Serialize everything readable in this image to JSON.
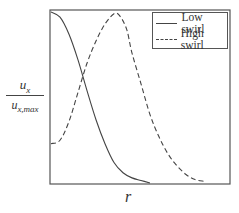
{
  "chart_data": {
    "type": "line",
    "title": "",
    "xlabel": "r",
    "ylabel": "u_x / u_x,max",
    "ylabel_numerator": "u",
    "ylabel_numerator_sub": "x",
    "ylabel_denominator": "u",
    "ylabel_denominator_sub": "x,max",
    "grid": false,
    "ticks": false,
    "legend_position": "upper right",
    "xlim": [
      0,
      1
    ],
    "ylim": [
      0,
      1
    ],
    "series": [
      {
        "name": "Low swirl",
        "style": "solid",
        "x": [
          0.0,
          0.05,
          0.1,
          0.15,
          0.2,
          0.25,
          0.3,
          0.35,
          0.4,
          0.45,
          0.5,
          0.55
        ],
        "y": [
          1.0,
          0.97,
          0.87,
          0.72,
          0.54,
          0.37,
          0.23,
          0.12,
          0.06,
          0.03,
          0.015,
          0.0
        ]
      },
      {
        "name": "High swirl",
        "style": "dashed",
        "x": [
          0.0,
          0.05,
          0.1,
          0.15,
          0.2,
          0.25,
          0.3,
          0.35,
          0.38,
          0.42,
          0.45,
          0.5,
          0.55,
          0.6,
          0.65,
          0.7,
          0.75,
          0.8,
          0.85
        ],
        "y": [
          0.23,
          0.25,
          0.36,
          0.53,
          0.7,
          0.83,
          0.93,
          0.99,
          0.98,
          0.9,
          0.76,
          0.58,
          0.4,
          0.27,
          0.17,
          0.1,
          0.05,
          0.02,
          0.01
        ]
      }
    ]
  },
  "legend": {
    "items": [
      {
        "label": "Low swirl"
      },
      {
        "label": "High swirl"
      }
    ]
  },
  "axes": {
    "x_label": "r",
    "y_num": "u",
    "y_num_sub": "x",
    "y_den": "u",
    "y_den_sub": "x,max"
  }
}
